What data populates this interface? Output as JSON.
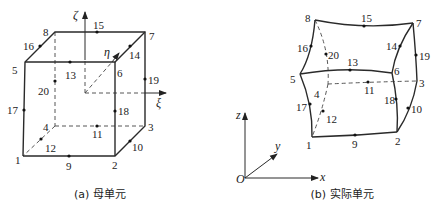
{
  "figure_a": {
    "caption": "(a) 母单元",
    "axes": {
      "zeta": "ζ",
      "eta": "η",
      "xi": "ξ"
    },
    "corner_nodes": [
      "1",
      "2",
      "3",
      "4",
      "5",
      "6",
      "7",
      "8"
    ],
    "midside_nodes": [
      "9",
      "10",
      "11",
      "12",
      "13",
      "14",
      "15",
      "16",
      "17",
      "18",
      "19",
      "20"
    ],
    "labels": {
      "n1": "1",
      "n2": "2",
      "n3": "3",
      "n4": "4",
      "n5": "5",
      "n6": "6",
      "n7": "7",
      "n8": "8",
      "n9": "9",
      "n10": "10",
      "n11": "11",
      "n12": "12",
      "n13": "13",
      "n14": "14",
      "n15": "15",
      "n16": "16",
      "n17": "17",
      "n18": "18",
      "n19": "19",
      "n20": "20"
    }
  },
  "figure_b": {
    "caption": "(b) 实际单元",
    "axes": {
      "origin": "O",
      "x": "x",
      "y": "y",
      "z": "z"
    },
    "labels": {
      "n1": "1",
      "n2": "2",
      "n3": "3",
      "n4": "4",
      "n5": "5",
      "n6": "6",
      "n7": "7",
      "n8": "8",
      "n9": "9",
      "n10": "10",
      "n11": "11",
      "n12": "12",
      "n13": "13",
      "n14": "14",
      "n15": "15",
      "n16": "16",
      "n17": "17",
      "n18": "18",
      "n19": "19",
      "n20": "20"
    }
  },
  "colors": {
    "line": "#2a2a2a",
    "background": "#ffffff"
  }
}
